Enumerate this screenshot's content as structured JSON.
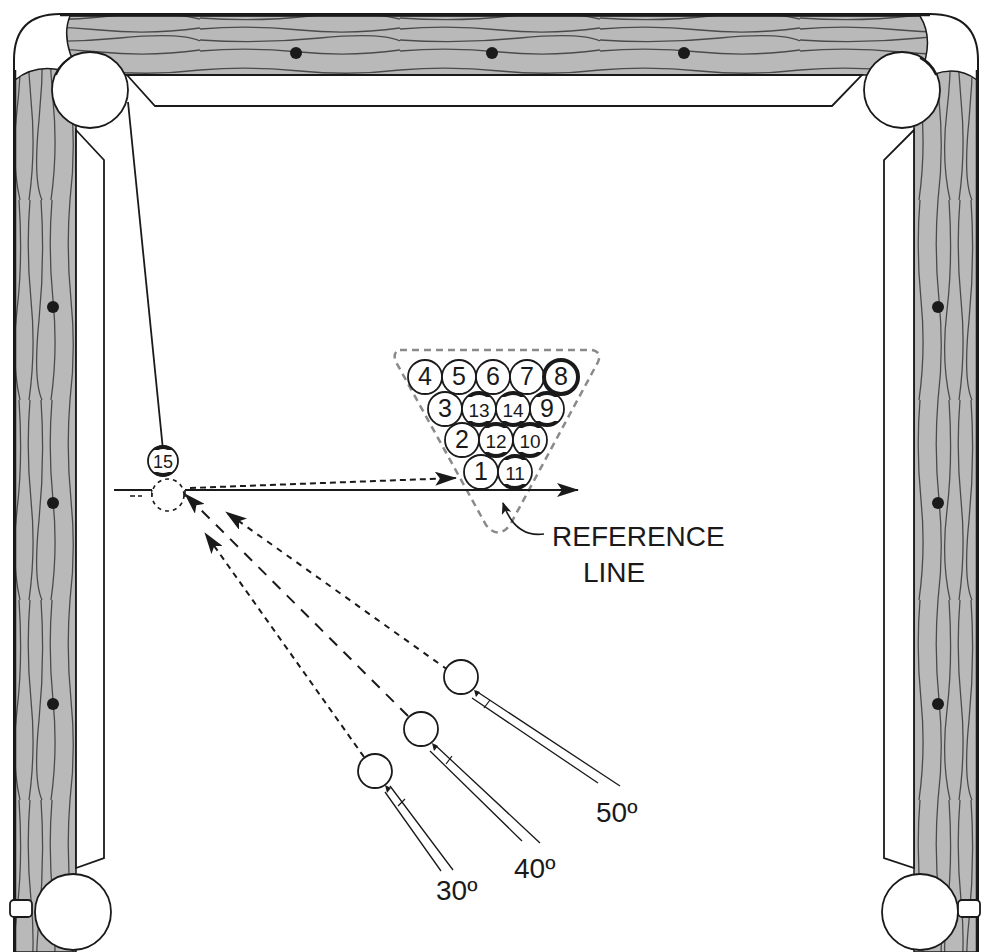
{
  "colors": {
    "rail": "#b9b9b9",
    "grain": "#4a4a4a",
    "ink": "#1a1a1a",
    "cloth": "#ffffff",
    "rack": "#8a8a8a"
  },
  "rack": {
    "rows": [
      [
        "4",
        "5",
        "6",
        "7",
        "8"
      ],
      [
        "3",
        "13",
        "14",
        "9"
      ],
      [
        "2",
        "12",
        "10"
      ],
      [
        "1",
        "11"
      ]
    ]
  },
  "object_ball": "15",
  "labels": {
    "reference_line_1": "REFERENCE",
    "reference_line_2": "LINE",
    "angle_30": "30º",
    "angle_40": "40º",
    "angle_50": "50º"
  }
}
